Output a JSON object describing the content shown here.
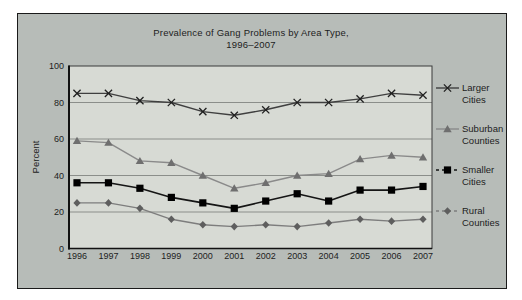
{
  "figure": {
    "title_line1": "Prevalence of Gang Problems by Area Type,",
    "title_line2": "1996–2007"
  },
  "chart_data": {
    "type": "line",
    "title": "Prevalence of Gang Problems by Area Type, 1996–2007",
    "xlabel": "",
    "ylabel": "Percent",
    "ylim": [
      0,
      100
    ],
    "yticks": [
      0,
      20,
      40,
      60,
      80,
      100
    ],
    "grid": true,
    "legend_position": "right",
    "categories": [
      "1996",
      "1997",
      "1998",
      "1999",
      "2000",
      "2001",
      "2002",
      "2003",
      "2004",
      "2005",
      "2006",
      "2007"
    ],
    "series": [
      {
        "name": "Larger Cities",
        "legend_lines": [
          "Larger",
          "Cities"
        ],
        "marker": "x",
        "legend_dash": false,
        "color": "#3f3f3f",
        "marker_color": "#1f1f1f",
        "values": [
          85,
          85,
          81,
          80,
          75,
          73,
          76,
          80,
          80,
          82,
          85,
          84
        ]
      },
      {
        "name": "Suburban Counties",
        "legend_lines": [
          "Suburban",
          "Counties"
        ],
        "marker": "triangle",
        "legend_dash": false,
        "color": "#8a8a8a",
        "marker_color": "#6f6f6f",
        "values": [
          59,
          58,
          48,
          47,
          40,
          33,
          36,
          40,
          41,
          49,
          51,
          50
        ]
      },
      {
        "name": "Smaller Cities",
        "legend_lines": [
          "Smaller",
          "Cities"
        ],
        "marker": "square",
        "legend_dash": true,
        "color": "#151515",
        "marker_color": "#000000",
        "values": [
          36,
          36,
          33,
          28,
          25,
          22,
          26,
          30,
          26,
          32,
          32,
          34
        ]
      },
      {
        "name": "Rural Counties",
        "legend_lines": [
          "Rural",
          "Counties"
        ],
        "marker": "diamond",
        "legend_dash": true,
        "color": "#7d7d7d",
        "marker_color": "#5e5e5e",
        "values": [
          25,
          25,
          22,
          16,
          13,
          12,
          13,
          12,
          14,
          16,
          15,
          16
        ]
      }
    ]
  },
  "colors": {
    "page_bg": "#ffffff",
    "panel_bg": "#b7bcb8",
    "plot_bg": "#d7dad4",
    "panel_border": "#1a1a1a",
    "grid": "#8b8e8a",
    "axis": "#111111",
    "text": "#1d1d1d"
  }
}
